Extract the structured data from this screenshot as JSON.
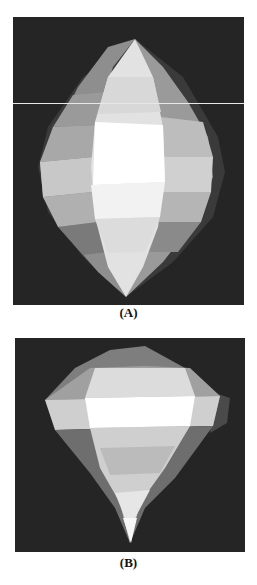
{
  "figure": {
    "panels": [
      {
        "id": "A",
        "label": "(A)",
        "description": "rendered faceted lens/lemon-shaped surface"
      },
      {
        "id": "B",
        "label": "(B)",
        "description": "rendered faceted teardrop/droplet-shaped surface"
      }
    ],
    "colors": {
      "background": "#252525",
      "page": "#ffffff"
    }
  }
}
